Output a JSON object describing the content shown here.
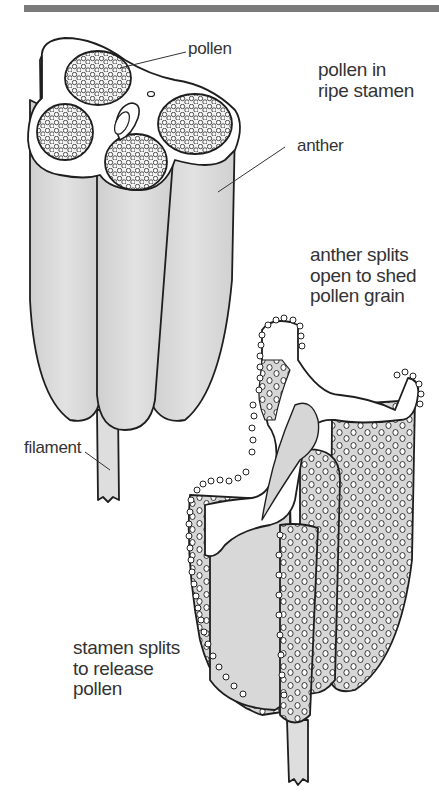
{
  "diagram": {
    "top_rule_color": "#7a7a7a",
    "fill_gray": "#dcdcdc",
    "stroke_color": "#1e1e1e",
    "labels": {
      "pollen": "pollen",
      "anther": "anther",
      "filament": "filament"
    },
    "captions": {
      "ripe": [
        "pollen in",
        "ripe stamen"
      ],
      "anther_splits": [
        "anther splits",
        "open to shed",
        "pollen grain"
      ],
      "stamen_splits": [
        "stamen splits",
        "to release",
        "pollen"
      ]
    },
    "figures": [
      {
        "name": "ripe-stamen",
        "parts": [
          "pollen",
          "anther",
          "filament"
        ]
      },
      {
        "name": "split-stamen",
        "parts": [
          "anther",
          "pollen grains",
          "filament"
        ]
      }
    ]
  }
}
